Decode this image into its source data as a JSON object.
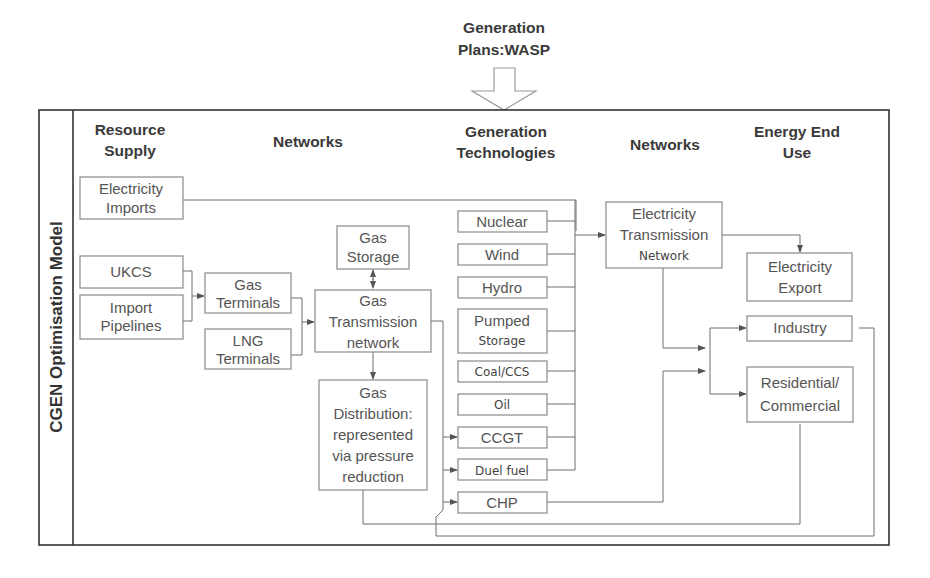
{
  "top_input": {
    "line1": "Generation",
    "line2": "Plans:WASP"
  },
  "side_label": "CGEN Optimisation Model",
  "columns": {
    "resource_supply": {
      "line1": "Resource",
      "line2": "Supply"
    },
    "networks_gas": "Networks",
    "generation": {
      "line1": "Generation",
      "line2": "Technologies"
    },
    "networks_elec": "Networks",
    "end_use": {
      "line1": "Energy End",
      "line2": "Use"
    }
  },
  "nodes": {
    "electricity_imports": {
      "line1": "Electricity",
      "line2": "Imports"
    },
    "ukcs": "UKCS",
    "import_pipelines": {
      "line1": "Import",
      "line2": "Pipelines"
    },
    "gas_terminals": {
      "line1": "Gas",
      "line2": "Terminals"
    },
    "lng_terminals": {
      "line1": "LNG",
      "line2": "Terminals"
    },
    "gas_storage": {
      "line1": "Gas",
      "line2": "Storage"
    },
    "gas_transmission": {
      "line1": "Gas",
      "line2": "Transmission",
      "line3": "network"
    },
    "gas_distribution": {
      "line1": "Gas",
      "line2": "Distribution:",
      "line3": "represented",
      "line4": "via pressure",
      "line5": "reduction"
    },
    "nuclear": "Nuclear",
    "wind": "Wind",
    "hydro": "Hydro",
    "pumped_storage": {
      "line1": "Pumped",
      "line2": "Storage"
    },
    "coal_ccs": "Coal/CCS",
    "oil": "Oil",
    "ccgt": "CCGT",
    "duel_fuel": "Duel fuel",
    "chp": "CHP",
    "elec_transmission": {
      "line1": "Electricity",
      "line2": "Transmission",
      "line3": "Network"
    },
    "electricity_export": {
      "line1": "Electricity",
      "line2": "Export"
    },
    "industry": "Industry",
    "residential_commercial": {
      "line1": "Residential/",
      "line2": "Commercial"
    }
  }
}
